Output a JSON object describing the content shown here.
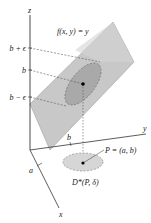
{
  "figure": {
    "axes": {
      "z_label": "z",
      "y_label": "y",
      "x_label": "x"
    },
    "surface_label": "f(x, y) = y",
    "z_ticks": [
      {
        "label": "b + ϵ",
        "y": 48
      },
      {
        "label": "b",
        "y": 70
      },
      {
        "label": "b − ϵ",
        "y": 97
      }
    ],
    "x_tick_label": "a",
    "y_tick_label": "b",
    "point_label": "P = (a, b)",
    "disk_label": "D*(P, δ)",
    "colors": {
      "plane_fill": "#c8c8c8",
      "plane_stroke": "#9a9a9a",
      "ellipse_fill": "#a9a9a9",
      "disk_fill": "#d6d6d6",
      "axis": "#333333",
      "dashes": "#555555"
    }
  }
}
